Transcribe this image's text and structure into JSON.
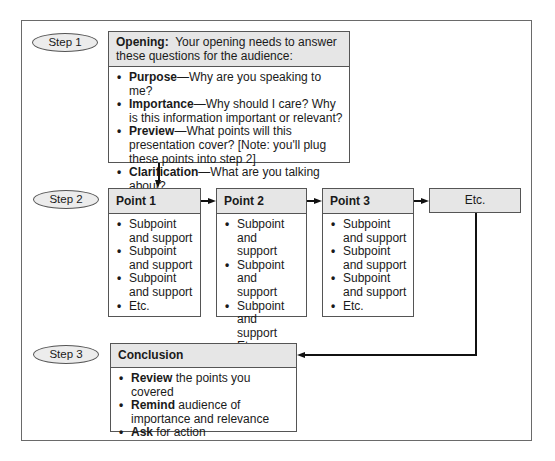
{
  "steps": [
    {
      "label": "Step 1"
    },
    {
      "label": "Step 2"
    },
    {
      "label": "Step 3"
    }
  ],
  "opening": {
    "title": "Opening:",
    "intro": "Your opening needs to answer these questions for the audience:",
    "items": [
      {
        "bold": "Purpose",
        "text": "—Why are you speaking to me?"
      },
      {
        "bold": "Importance",
        "text": "—Why should I care? Why is this information important or relevant?"
      },
      {
        "bold": "Preview",
        "text": "—What points will this presentation cover? [Note: you'll plug these points into step 2]"
      },
      {
        "bold": "Clarification",
        "text": "—What are you talking about?"
      }
    ]
  },
  "points": [
    {
      "title": "Point 1",
      "items": [
        "Subpoint and support",
        "Subpoint and support",
        "Subpoint and support",
        "Etc."
      ]
    },
    {
      "title": "Point 2",
      "items": [
        "Subpoint and support",
        "Subpoint and support",
        "Subpoint and support",
        "Etc."
      ]
    },
    {
      "title": "Point 3",
      "items": [
        "Subpoint and support",
        "Subpoint and support",
        "Subpoint and support",
        "Etc."
      ]
    }
  ],
  "etc_box": {
    "label": "Etc."
  },
  "conclusion": {
    "title": "Conclusion",
    "items": [
      {
        "bold": "Review",
        "text": " the points you covered"
      },
      {
        "bold": "Remind",
        "text": " audience of importance and relevance"
      },
      {
        "bold": "Ask",
        "text": " for action"
      }
    ]
  }
}
